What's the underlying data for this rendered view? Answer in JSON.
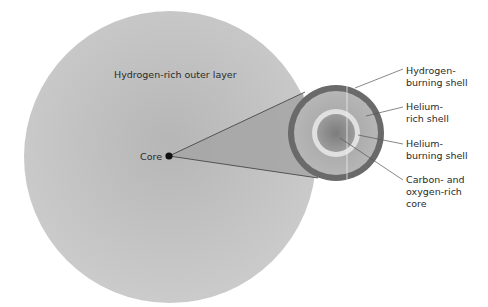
{
  "diagram": {
    "outer_layer_label": "Hydrogen-rich outer layer",
    "core_label": "Core",
    "callouts": [
      {
        "lines": [
          "Hydrogen-",
          "burning shell"
        ]
      },
      {
        "lines": [
          "Helium-",
          "rich shell"
        ]
      },
      {
        "lines": [
          "Helium-",
          "burning shell"
        ]
      },
      {
        "lines": [
          "Carbon- and",
          "oxygen-rich",
          "core"
        ]
      }
    ],
    "colors": {
      "outer_layer": "#c4c4c4",
      "outer_layer_center": "#b4b4b4",
      "cone": "#a9a9a9",
      "hydrogen_burning_shell": "#6b6b6b",
      "helium_rich_shell": "#ababab",
      "helium_burning_shell": "#e2e2e2",
      "co_core": "#8e8e8e",
      "core_dot": "#111111",
      "leader_lines": "#555555"
    }
  }
}
